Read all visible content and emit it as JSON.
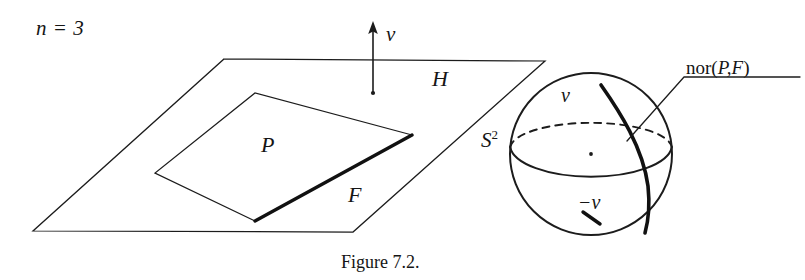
{
  "figure": {
    "caption": "Figure 7.2.",
    "dimension_label": "n = 3",
    "labels": {
      "hyperplane": "H",
      "polytope": "P",
      "face": "F",
      "normal_vector": "v",
      "negative_normal_vector": "−v",
      "sphere": "S",
      "sphere_superscript": "2",
      "normal_cone_prefix": "nor(",
      "normal_cone_args": "P,F",
      "normal_cone_suffix": ")"
    }
  },
  "geometry": {
    "hyperplane_H": {
      "name": "H",
      "type": "parallelogram",
      "points": "224,59 545,61 353,232 33,231"
    },
    "polytope_P": {
      "name": "P",
      "type": "quadrilateral",
      "points": "255,93 412,135 255,221 155,173"
    },
    "face_F": {
      "name": "F",
      "type": "edge",
      "from": "412,135",
      "to": "255,221"
    },
    "normal_arrow_v": {
      "name": "v",
      "x": 373,
      "tip_y": 22,
      "base_y": 93,
      "head_half_width": 5,
      "head_length": 13
    },
    "sphere_S2": {
      "name": "S2",
      "center_x": 591,
      "center_y": 154,
      "radius": 81
    },
    "equator_front_arc": {
      "type": "solid-arc",
      "description": "front lower half of equator ellipse"
    },
    "equator_back_arc": {
      "type": "dashed-arc",
      "description": "rear upper half of equator ellipse"
    },
    "geodesic_nor_PF": {
      "name": "nor(P,F)",
      "description": "great-circle arc from north pole v to south region",
      "from": "602,86",
      "to": "646,232"
    },
    "center_dot": {
      "x": 591,
      "y": 154,
      "r": 1.9
    },
    "minus_v_tick": {
      "from": "584,213",
      "to": "600,224"
    },
    "leader_line": {
      "from": "627,142",
      "via": "684,76",
      "to": "800,76"
    },
    "nor_label_underline": {
      "from": "684,76",
      "to": "800,76"
    }
  },
  "style": {
    "ink_color": "#1c1c1c",
    "background_color": "#ffffff"
  }
}
